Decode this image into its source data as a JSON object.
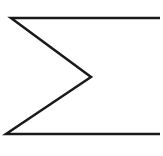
{
  "symbol": {
    "name": "summation",
    "glyph": "Σ",
    "stroke_color": "#1a1a1a",
    "background": "#ffffff",
    "stroke_width": 2.5,
    "points": {
      "top_left": [
        11,
        18
      ],
      "top_right": [
        160,
        18
      ],
      "apex": [
        91,
        77
      ],
      "bottom_left": [
        6,
        134
      ],
      "bottom_right": [
        160,
        134
      ]
    }
  }
}
